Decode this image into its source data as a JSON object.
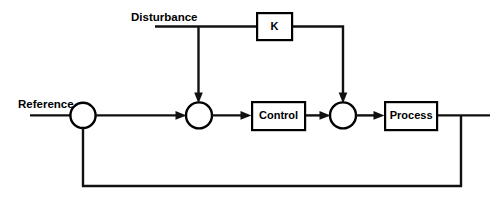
{
  "diagram": {
    "type": "control-system-block-diagram",
    "canvas": {
      "width": 498,
      "height": 201,
      "background": "#ffffff"
    },
    "line_color": "#111111",
    "text_color": "#000000",
    "signals": {
      "reference": {
        "label": "Reference",
        "x": 18,
        "y": 105
      },
      "disturbance": {
        "label": "Disturbance",
        "x": 131,
        "y": 18
      }
    },
    "blocks": [
      {
        "id": "k",
        "label": "K",
        "x": 256,
        "y": 12,
        "width": 37,
        "height": 29
      },
      {
        "id": "control",
        "label": "Control",
        "x": 251,
        "y": 101,
        "width": 55,
        "height": 30
      },
      {
        "id": "process",
        "label": "Process",
        "x": 384,
        "y": 101,
        "width": 54,
        "height": 30
      }
    ],
    "summing_junctions": [
      {
        "id": "sum-reference-feedback",
        "cx": 83,
        "cy": 115,
        "r": 12.6
      },
      {
        "id": "sum-error-disturbance",
        "cx": 199,
        "cy": 115,
        "r": 13
      },
      {
        "id": "sum-control-feedforward",
        "cx": 343,
        "cy": 115,
        "r": 13
      }
    ],
    "connections": [
      {
        "id": "reference-in",
        "from": "Reference",
        "to": "sum-reference-feedback"
      },
      {
        "id": "sum1-to-sum2",
        "from": "sum-reference-feedback",
        "to": "sum-error-disturbance"
      },
      {
        "id": "disturbance-in",
        "from": "Disturbance",
        "to": "branch"
      },
      {
        "id": "branch-to-k",
        "from": "branch",
        "to": "K"
      },
      {
        "id": "branch-to-sum2",
        "from": "branch",
        "to": "sum-error-disturbance"
      },
      {
        "id": "k-to-sum3",
        "from": "K",
        "to": "sum-control-feedforward"
      },
      {
        "id": "sum2-to-control",
        "from": "sum-error-disturbance",
        "to": "Control"
      },
      {
        "id": "control-to-sum3",
        "from": "Control",
        "to": "sum-control-feedforward"
      },
      {
        "id": "sum3-to-process",
        "from": "sum-control-feedforward",
        "to": "Process"
      },
      {
        "id": "process-out",
        "from": "Process",
        "to": "output"
      },
      {
        "id": "feedback-loop",
        "from": "output",
        "to": "sum-reference-feedback"
      }
    ]
  }
}
